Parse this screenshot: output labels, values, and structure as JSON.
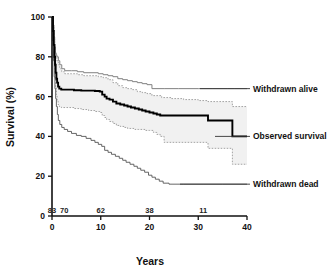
{
  "chart_data": {
    "type": "line",
    "title": "",
    "xlabel": "Years",
    "ylabel": "Survival (%)",
    "xlim": [
      0,
      40
    ],
    "ylim": [
      0,
      100
    ],
    "xticks": [
      "0",
      "10",
      "20",
      "30",
      "40"
    ],
    "xtick_values": [
      0,
      10,
      20,
      30,
      40
    ],
    "yticks": [
      "0",
      "20",
      "40",
      "60",
      "80",
      "100"
    ],
    "ytick_values": [
      0,
      20,
      40,
      60,
      80,
      100
    ],
    "grid": false,
    "legend_position": "inline-right-annotations",
    "numbers_at_risk": {
      "label": "Number at risk",
      "values": [
        "83",
        "70",
        "62",
        "38",
        "11"
      ],
      "at_years": [
        0,
        2.5,
        10,
        20,
        31
      ]
    },
    "annotations": [
      {
        "text": "Withdrawn alive",
        "series": "withdrawn_alive",
        "x": 40,
        "y": 64
      },
      {
        "text": "Observed survival",
        "series": "observed_survival",
        "x": 40,
        "y": 43
      },
      {
        "text": "Withdrawn dead",
        "series": "withdrawn_dead",
        "x": 40,
        "y": 16
      }
    ],
    "series": [
      {
        "name": "Withdrawn alive",
        "style": "thin-gray-step",
        "color": "#808080",
        "points": [
          [
            0,
            100
          ],
          [
            0.25,
            96
          ],
          [
            0.4,
            90
          ],
          [
            0.55,
            85
          ],
          [
            0.7,
            82
          ],
          [
            0.85,
            81
          ],
          [
            1.0,
            80
          ],
          [
            1.3,
            78
          ],
          [
            1.6,
            76
          ],
          [
            2.0,
            74
          ],
          [
            2.6,
            73
          ],
          [
            4.0,
            73
          ],
          [
            5.2,
            72.5
          ],
          [
            6.5,
            72
          ],
          [
            8.0,
            72
          ],
          [
            9.5,
            71.5
          ],
          [
            10.5,
            71
          ],
          [
            11.5,
            70.5
          ],
          [
            12.5,
            70
          ],
          [
            13.5,
            69
          ],
          [
            14.5,
            68.5
          ],
          [
            15.5,
            68
          ],
          [
            16.5,
            67.5
          ],
          [
            17.5,
            67
          ],
          [
            18.5,
            66.5
          ],
          [
            19.5,
            66
          ],
          [
            20.5,
            64
          ],
          [
            23.0,
            64
          ],
          [
            26.0,
            64
          ],
          [
            30.0,
            64
          ],
          [
            33.0,
            64
          ],
          [
            36.0,
            64
          ],
          [
            37.5,
            64
          ],
          [
            40,
            64
          ]
        ]
      },
      {
        "name": "Upper 95% CI",
        "style": "dotted",
        "color": "#9a9a9a",
        "points": [
          [
            0,
            100
          ],
          [
            0.25,
            95
          ],
          [
            0.4,
            89
          ],
          [
            0.55,
            84
          ],
          [
            0.7,
            81.5
          ],
          [
            0.85,
            80
          ],
          [
            1.0,
            78
          ],
          [
            1.3,
            76
          ],
          [
            1.6,
            74
          ],
          [
            2.0,
            72.5
          ],
          [
            2.6,
            71.5
          ],
          [
            4.0,
            71.5
          ],
          [
            5.2,
            71
          ],
          [
            6.5,
            70.5
          ],
          [
            8.0,
            70.5
          ],
          [
            9.5,
            70
          ],
          [
            10.5,
            69.5
          ],
          [
            11.5,
            68.5
          ],
          [
            12.5,
            67
          ],
          [
            13.5,
            65.5
          ],
          [
            14.5,
            64.5
          ],
          [
            15.5,
            64
          ],
          [
            16.5,
            63.5
          ],
          [
            17.5,
            62.5
          ],
          [
            18.5,
            62
          ],
          [
            19.5,
            61.5
          ],
          [
            20.5,
            60.5
          ],
          [
            22.5,
            59.5
          ],
          [
            24.5,
            59
          ],
          [
            27.0,
            58.5
          ],
          [
            30.0,
            58
          ],
          [
            32.0,
            57.5
          ],
          [
            34.0,
            57.5
          ],
          [
            36.5,
            57.5
          ],
          [
            37.0,
            55
          ],
          [
            40,
            55
          ]
        ]
      },
      {
        "name": "Observed survival",
        "style": "thick-black-step",
        "color": "#000000",
        "points": [
          [
            0,
            100
          ],
          [
            0.2,
            93
          ],
          [
            0.35,
            86
          ],
          [
            0.5,
            80
          ],
          [
            0.62,
            76
          ],
          [
            0.75,
            72
          ],
          [
            0.9,
            69
          ],
          [
            1.05,
            67
          ],
          [
            1.25,
            65
          ],
          [
            1.5,
            64
          ],
          [
            1.9,
            63.5
          ],
          [
            3.0,
            63.5
          ],
          [
            4.5,
            63.2
          ],
          [
            6.0,
            63
          ],
          [
            7.5,
            63
          ],
          [
            8.8,
            62.8
          ],
          [
            9.8,
            62.5
          ],
          [
            10.3,
            61
          ],
          [
            10.8,
            60
          ],
          [
            11.2,
            59
          ],
          [
            11.8,
            58.5
          ],
          [
            12.5,
            57.5
          ],
          [
            13.2,
            56.5
          ],
          [
            14.0,
            56
          ],
          [
            14.8,
            55.5
          ],
          [
            15.5,
            55
          ],
          [
            16.2,
            54.5
          ],
          [
            17.0,
            54
          ],
          [
            17.8,
            53.5
          ],
          [
            18.5,
            53
          ],
          [
            19.2,
            52.5
          ],
          [
            20.0,
            52
          ],
          [
            20.8,
            51.5
          ],
          [
            21.5,
            51
          ],
          [
            22.2,
            50.5
          ],
          [
            23.0,
            50.5
          ],
          [
            26.0,
            50.5
          ],
          [
            29.0,
            50.5
          ],
          [
            31.5,
            50.5
          ],
          [
            32.0,
            48
          ],
          [
            34.0,
            48
          ],
          [
            36.5,
            48
          ],
          [
            37.0,
            40
          ],
          [
            40,
            40
          ]
        ]
      },
      {
        "name": "Lower 95% CI",
        "style": "dotted",
        "color": "#9a9a9a",
        "points": [
          [
            0,
            100
          ],
          [
            0.2,
            90
          ],
          [
            0.35,
            82
          ],
          [
            0.5,
            74
          ],
          [
            0.62,
            69
          ],
          [
            0.75,
            65
          ],
          [
            0.9,
            61
          ],
          [
            1.05,
            58
          ],
          [
            1.25,
            56
          ],
          [
            1.5,
            55
          ],
          [
            1.9,
            54.5
          ],
          [
            3.0,
            54.5
          ],
          [
            4.5,
            54
          ],
          [
            6.0,
            53.5
          ],
          [
            7.5,
            53
          ],
          [
            8.8,
            52.5
          ],
          [
            9.8,
            52
          ],
          [
            10.3,
            50.5
          ],
          [
            10.8,
            49.5
          ],
          [
            11.2,
            48.5
          ],
          [
            11.8,
            47.5
          ],
          [
            12.5,
            46.5
          ],
          [
            13.2,
            45.5
          ],
          [
            14.0,
            45
          ],
          [
            14.8,
            44.5
          ],
          [
            15.5,
            44
          ],
          [
            16.2,
            44
          ],
          [
            17.0,
            43.5
          ],
          [
            17.8,
            43.5
          ],
          [
            18.5,
            43.5
          ],
          [
            19.2,
            43
          ],
          [
            20.0,
            43
          ],
          [
            20.8,
            42
          ],
          [
            21.5,
            41
          ],
          [
            22.2,
            40
          ],
          [
            23.0,
            37
          ],
          [
            26.0,
            37
          ],
          [
            29.0,
            37
          ],
          [
            31.5,
            37
          ],
          [
            32.0,
            34
          ],
          [
            34.0,
            34
          ],
          [
            36.5,
            34
          ],
          [
            37.0,
            26
          ],
          [
            40,
            26
          ]
        ]
      },
      {
        "name": "Withdrawn dead",
        "style": "thin-step",
        "color": "#555555",
        "points": [
          [
            0,
            100
          ],
          [
            0.15,
            88
          ],
          [
            0.3,
            78
          ],
          [
            0.45,
            70
          ],
          [
            0.6,
            64
          ],
          [
            0.75,
            59
          ],
          [
            0.9,
            55
          ],
          [
            1.1,
            51
          ],
          [
            1.3,
            48
          ],
          [
            1.6,
            46
          ],
          [
            2.0,
            44.5
          ],
          [
            2.5,
            43.5
          ],
          [
            3.2,
            42.5
          ],
          [
            4.0,
            41.5
          ],
          [
            5.0,
            40.5
          ],
          [
            6.0,
            40
          ],
          [
            7.0,
            39
          ],
          [
            8.0,
            38
          ],
          [
            8.8,
            37
          ],
          [
            9.5,
            36
          ],
          [
            10.2,
            35
          ],
          [
            10.8,
            33
          ],
          [
            11.5,
            32
          ],
          [
            12.2,
            31
          ],
          [
            13.0,
            30
          ],
          [
            13.8,
            29
          ],
          [
            14.5,
            28
          ],
          [
            15.2,
            27
          ],
          [
            16.0,
            26
          ],
          [
            16.8,
            25
          ],
          [
            17.5,
            24
          ],
          [
            18.2,
            23
          ],
          [
            19.0,
            22
          ],
          [
            19.8,
            20.5
          ],
          [
            20.5,
            19.5
          ],
          [
            21.2,
            18.5
          ],
          [
            22.0,
            17.5
          ],
          [
            22.8,
            16.5
          ],
          [
            24.0,
            16
          ],
          [
            27.0,
            16
          ],
          [
            31.0,
            16
          ],
          [
            35.0,
            16
          ],
          [
            40,
            16
          ]
        ]
      }
    ],
    "band": {
      "name": "95% confidence band",
      "fill_color": "#f1f1f1",
      "upper_series": "Upper 95% CI",
      "lower_series": "Lower 95% CI"
    }
  },
  "colors": {
    "axis": "#111111",
    "observed": "#000000",
    "withdrawn_alive": "#808080",
    "withdrawn_dead": "#555555",
    "ci_line": "#9a9a9a",
    "band_fill": "#f1f1f1",
    "background": "#ffffff"
  }
}
